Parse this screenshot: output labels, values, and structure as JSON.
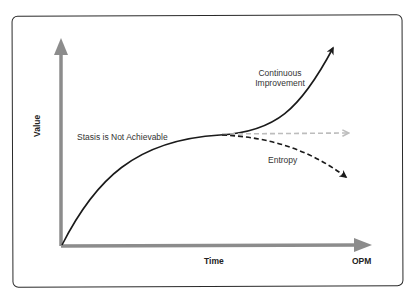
{
  "diagram": {
    "type": "concept-curve",
    "axes": {
      "y_label": "Value",
      "x_label": "Time",
      "corner_label": "OPM"
    },
    "annotations": {
      "stasis": "Stasis is Not Achievable",
      "improvement_line1": "Continuous",
      "improvement_line2": "Improvement",
      "entropy": "Entropy"
    },
    "paths": [
      {
        "name": "growth-to-inflection",
        "style": "solid",
        "color": "#1a1a1a"
      },
      {
        "name": "continuous-improvement",
        "style": "solid-arrow",
        "color": "#1a1a1a"
      },
      {
        "name": "stasis",
        "style": "dashed-arrow",
        "color": "#bdbdbd"
      },
      {
        "name": "entropy",
        "style": "dashed-arrow",
        "color": "#1a1a1a"
      }
    ],
    "colors": {
      "axis": "#8c8c8c",
      "curve": "#1a1a1a",
      "stasis": "#bdbdbd",
      "frame": "#2a2a2a"
    }
  }
}
